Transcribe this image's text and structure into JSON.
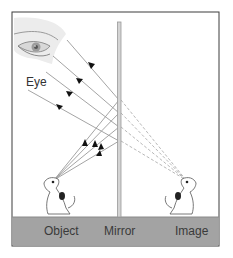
{
  "diagram": {
    "type": "plane-mirror-reflection",
    "labels": {
      "eye": "Eye",
      "object": "Object",
      "mirror": "Mirror",
      "image": "Image"
    },
    "colors": {
      "frame": "#3c3c3c",
      "floor": "#a3a3a3",
      "mirror": "#c8c8c8",
      "ray": "#9a9a9a",
      "dashed_ray": "#b0b0b0",
      "arrow": "#111111",
      "label_text": "#333333"
    },
    "icons": [
      "eye-icon",
      "dog-object-icon",
      "dog-image-icon"
    ],
    "rays": {
      "count": 4,
      "object_point": [
        54,
        180
      ],
      "image_point": [
        186,
        180
      ],
      "mirror_x": 119,
      "mirror_hits_y": [
        100,
        113,
        127,
        141
      ]
    }
  }
}
